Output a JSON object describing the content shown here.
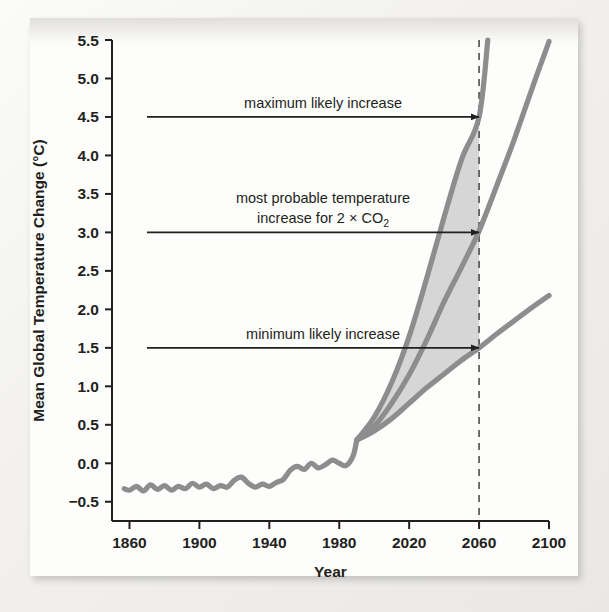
{
  "figure": {
    "background_color": "#f2f1ef",
    "panel_color": "#fdfdfc",
    "ink_color": "#231f20",
    "curve_color": "#8d8d8d",
    "band_color": "#cfcfcf"
  },
  "chart_data": {
    "type": "line",
    "title": "",
    "xlabel": "Year",
    "ylabel": "Mean Global Temperature Change (°C)",
    "xlim": [
      1850,
      2100
    ],
    "ylim": [
      -0.75,
      5.5
    ],
    "grid": false,
    "legend_position": "none",
    "xticks": [
      1860,
      1900,
      1940,
      1980,
      2020,
      2060,
      2100
    ],
    "xtick_labels": [
      "1860",
      "1900",
      "1940",
      "1980",
      "2020",
      "2060",
      "2100"
    ],
    "yticks": [
      -0.5,
      0.0,
      0.5,
      1.0,
      1.5,
      2.0,
      2.5,
      3.0,
      3.5,
      4.0,
      4.5,
      5.0,
      5.5
    ],
    "ytick_labels": [
      "−0.5",
      "0.0",
      "0.5",
      "1.0",
      "1.5",
      "2.0",
      "2.5",
      "3.0",
      "3.5",
      "4.0",
      "4.5",
      "5.0",
      "5.5"
    ],
    "reference_line": {
      "x": 2060,
      "style": "dashed",
      "label": "2060"
    },
    "series": [
      {
        "name": "observed-record",
        "style": "solid",
        "x": [
          1857,
          1860,
          1864,
          1868,
          1872,
          1876,
          1880,
          1884,
          1888,
          1892,
          1896,
          1900,
          1904,
          1908,
          1912,
          1916,
          1920,
          1924,
          1928,
          1932,
          1936,
          1940,
          1944,
          1948,
          1952,
          1956,
          1960,
          1964,
          1968,
          1972,
          1976,
          1980,
          1984,
          1988,
          1990
        ],
        "y": [
          -0.33,
          -0.35,
          -0.3,
          -0.36,
          -0.28,
          -0.34,
          -0.29,
          -0.35,
          -0.3,
          -0.33,
          -0.26,
          -0.31,
          -0.27,
          -0.33,
          -0.29,
          -0.31,
          -0.22,
          -0.18,
          -0.26,
          -0.31,
          -0.27,
          -0.3,
          -0.25,
          -0.21,
          -0.09,
          -0.04,
          -0.08,
          0.0,
          -0.06,
          -0.02,
          0.04,
          0.0,
          -0.03,
          0.1,
          0.3
        ]
      },
      {
        "name": "maximum-likely-increase",
        "style": "solid",
        "x": [
          1990,
          2000,
          2010,
          2020,
          2030,
          2040,
          2050,
          2060,
          2065
        ],
        "y": [
          0.3,
          0.6,
          1.05,
          1.65,
          2.4,
          3.2,
          3.95,
          4.5,
          5.5
        ]
      },
      {
        "name": "most-probable-increase",
        "style": "solid",
        "x": [
          1990,
          2000,
          2010,
          2020,
          2030,
          2040,
          2050,
          2060,
          2070,
          2080,
          2090,
          2100
        ],
        "y": [
          0.3,
          0.48,
          0.78,
          1.15,
          1.6,
          2.1,
          2.55,
          3.02,
          3.6,
          4.2,
          4.85,
          5.48
        ]
      },
      {
        "name": "minimum-likely-increase",
        "style": "solid",
        "x": [
          1990,
          2000,
          2010,
          2020,
          2030,
          2040,
          2050,
          2060,
          2070,
          2080,
          2090,
          2100
        ],
        "y": [
          0.3,
          0.42,
          0.58,
          0.78,
          0.98,
          1.16,
          1.34,
          1.5,
          1.68,
          1.85,
          2.02,
          2.18
        ]
      }
    ],
    "shaded_band": {
      "name": "likely-range-band",
      "upper_series": "maximum-likely-increase",
      "lower_series": "minimum-likely-increase",
      "x_start": 1990,
      "x_end": 2060
    },
    "annotations": [
      {
        "id": "max",
        "text": "maximum likely increase",
        "value": 4.5,
        "arrow_from_year": 1870,
        "arrow_to_year": 2060
      },
      {
        "id": "probable",
        "text_line1": "most probable temperature",
        "text_line2_pre": "increase for 2 × CO",
        "text_line2_sub": "2",
        "value": 3.0,
        "arrow_from_year": 1870,
        "arrow_to_year": 2060
      },
      {
        "id": "min",
        "text": "minimum likely increase",
        "value": 1.5,
        "arrow_from_year": 1870,
        "arrow_to_year": 2060
      }
    ]
  }
}
